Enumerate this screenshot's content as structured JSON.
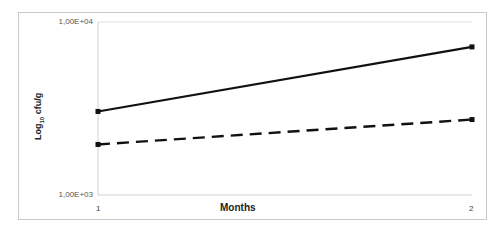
{
  "chart_data": {
    "type": "line",
    "title": "",
    "xlabel": "Months",
    "ylabel": "Log10 cfu/g",
    "yscale": "log",
    "ylim": [
      1000,
      10000
    ],
    "y_tick_labels": [
      "1,00E+04",
      "1,00E+03"
    ],
    "x": [
      1,
      2
    ],
    "x_tick_labels": [
      "1",
      "2"
    ],
    "grid": false,
    "legend": null,
    "series": [
      {
        "name": "solid",
        "style": "solid",
        "color": "#111111",
        "values": [
          3040,
          7180
        ]
      },
      {
        "name": "dashed",
        "style": "dashed",
        "color": "#111111",
        "values": [
          1960,
          2730
        ]
      }
    ]
  },
  "labels": {
    "ytick_top": "1,00E+04",
    "ytick_bottom": "1,00E+03",
    "xtick_1": "1",
    "xtick_2": "2",
    "xlabel": "Months",
    "ylabel_main": "Log",
    "ylabel_sub": "10",
    "ylabel_rest": " cfu/g"
  }
}
